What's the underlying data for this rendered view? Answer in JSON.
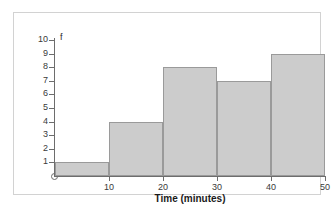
{
  "chart_data": {
    "type": "bar",
    "title": "",
    "subtitle": "",
    "xlabel": "Time (minutes)",
    "ylabel": "f",
    "categories": [
      "0-10",
      "10-20",
      "20-30",
      "30-40",
      "40-50"
    ],
    "values": [
      1,
      4,
      8,
      7,
      9
    ],
    "bin_edges": [
      0,
      10,
      20,
      30,
      40,
      50
    ],
    "bin_width": 10,
    "xlim": [
      0,
      50
    ],
    "ylim": [
      0,
      10
    ],
    "x_ticks": [
      10,
      20,
      30,
      40,
      50
    ],
    "x_tick_labels": [
      "10",
      "20",
      "30",
      "40",
      "50"
    ],
    "y_ticks": [
      1,
      2,
      3,
      4,
      5,
      6,
      7,
      8,
      9,
      10
    ],
    "y_tick_labels": [
      "1",
      "2",
      "3",
      "4",
      "5",
      "6",
      "7",
      "8",
      "9",
      "10"
    ],
    "grid": false,
    "legend": false,
    "legend_position": "none",
    "bar_fill_color": "#cccccc",
    "bar_edge_color": "#9a9a9a",
    "axis_color": "#6d6d6d",
    "frame_color": "#d2d2d2",
    "background_color": "#ffffff",
    "origin_marker": "circle"
  }
}
